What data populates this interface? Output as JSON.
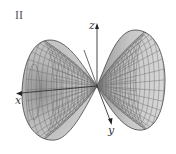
{
  "figure": {
    "panel_label": "II",
    "axes": {
      "x_label": "x",
      "y_label": "y",
      "z_label": "z"
    },
    "colors": {
      "background": "#ffffff",
      "surface_fill": "#c4c4c4",
      "surface_dark": "#8a8a8a",
      "mesh_line": "#6e6e6e",
      "axis_line": "#333333"
    },
    "mesh": {
      "radial_lines": 30,
      "rings": 14
    }
  }
}
